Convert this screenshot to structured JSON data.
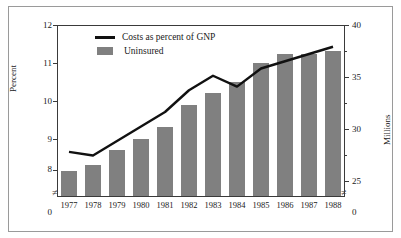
{
  "chart_data": {
    "type": "bar",
    "title": "",
    "subtitle": "",
    "xlabel": "",
    "ylabel": "Percent",
    "y2label": "Millions",
    "categories": [
      "1977",
      "1978",
      "1979",
      "1980",
      "1981",
      "1982",
      "1983",
      "1984",
      "1985",
      "1986",
      "1987",
      "1988"
    ],
    "ylim": [
      8,
      12
    ],
    "y2lim": [
      24,
      40
    ],
    "yticks": [
      "12",
      "11",
      "10",
      "9",
      "8"
    ],
    "ytick_values": [
      12,
      11,
      10,
      9,
      8
    ],
    "y2ticks": [
      "40",
      "35",
      "30",
      "25"
    ],
    "y2tick_values": [
      40,
      35,
      30,
      25
    ],
    "y_axis_break": true,
    "y_axis_origin_label": "0",
    "y2_axis_origin_label": "0",
    "grid": false,
    "legend_position": "upper left inside",
    "series": [
      {
        "name": "Costs as percent of GNP",
        "type": "line",
        "axis": "left",
        "unit": "percent",
        "color": "#111111",
        "values": [
          8.5,
          8.4,
          8.8,
          9.2,
          9.6,
          10.2,
          10.6,
          10.3,
          10.8,
          11.0,
          11.2,
          11.4
        ]
      },
      {
        "name": "Uninsured",
        "type": "bar",
        "axis": "right",
        "unit": "millions",
        "color": "#808080",
        "values": [
          26.0,
          26.5,
          28.0,
          29.0,
          30.2,
          32.3,
          33.5,
          34.5,
          36.3,
          37.2,
          37.2,
          37.5
        ]
      }
    ]
  },
  "legend": {
    "items": [
      {
        "label": "Costs as percent of GNP",
        "marker": "line-marker",
        "color": "#111111"
      },
      {
        "label": "Uninsured",
        "marker": "bar-swatch",
        "color": "#808080"
      }
    ]
  },
  "axes": {
    "left_title": "Percent",
    "right_title": "Millions",
    "break_glyph": "≠",
    "zero_label": "0"
  }
}
